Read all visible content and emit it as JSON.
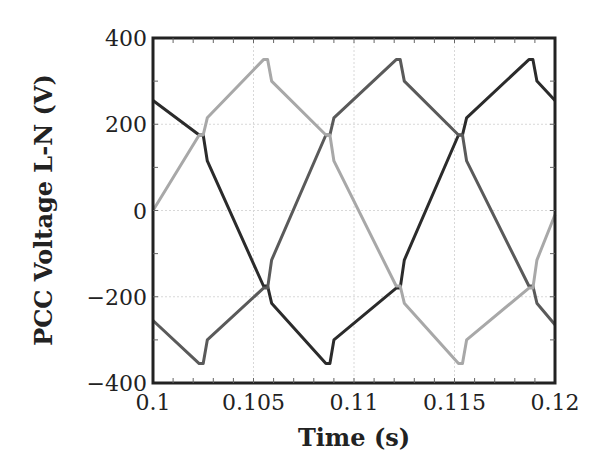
{
  "chart_data": {
    "type": "line",
    "title": "",
    "xlabel": "Time (s)",
    "ylabel": "PCC Voltage L-N (V)",
    "xlim": [
      0.1,
      0.12
    ],
    "ylim": [
      -400,
      400
    ],
    "xticks": [
      "0.1",
      "0.105",
      "0.11",
      "0.115",
      "0.12"
    ],
    "yticks": [
      "400",
      "200",
      "0",
      "−200",
      "−400"
    ],
    "grid": true,
    "legend": null,
    "series": [
      {
        "name": "Phase A",
        "color": "#2b2b2b",
        "x": [
          0.1,
          0.1023,
          0.1025,
          0.1027,
          0.1055,
          0.1057,
          0.1059,
          0.1086,
          0.1088,
          0.109,
          0.1121,
          0.1123,
          0.1125,
          0.1152,
          0.1154,
          0.1156,
          0.1187,
          0.1189,
          0.1191,
          0.12
        ],
        "y": [
          255,
          175,
          175,
          115,
          -175,
          -175,
          -215,
          -355,
          -355,
          -300,
          -180,
          -180,
          -115,
          175,
          175,
          215,
          350,
          350,
          300,
          255
        ]
      },
      {
        "name": "Phase B",
        "color": "#5a5a5a",
        "x": [
          0.1,
          0.1023,
          0.1025,
          0.1027,
          0.1055,
          0.1057,
          0.1059,
          0.1086,
          0.1088,
          0.109,
          0.1121,
          0.1123,
          0.1125,
          0.1152,
          0.1154,
          0.1156,
          0.1187,
          0.1189,
          0.1191,
          0.12
        ],
        "y": [
          -255,
          -355,
          -355,
          -300,
          -180,
          -180,
          -115,
          175,
          175,
          215,
          350,
          350,
          300,
          175,
          175,
          115,
          -175,
          -175,
          -215,
          -265
        ]
      },
      {
        "name": "Phase C",
        "color": "#a8a8a8",
        "x": [
          0.1,
          0.1023,
          0.1025,
          0.1027,
          0.1055,
          0.1057,
          0.1059,
          0.1086,
          0.1088,
          0.109,
          0.1121,
          0.1123,
          0.1125,
          0.1152,
          0.1154,
          0.1156,
          0.1187,
          0.1189,
          0.1191,
          0.12
        ],
        "y": [
          0,
          175,
          175,
          215,
          350,
          350,
          300,
          175,
          175,
          115,
          -175,
          -175,
          -215,
          -355,
          -355,
          -300,
          -180,
          -180,
          -115,
          -10
        ]
      }
    ]
  }
}
